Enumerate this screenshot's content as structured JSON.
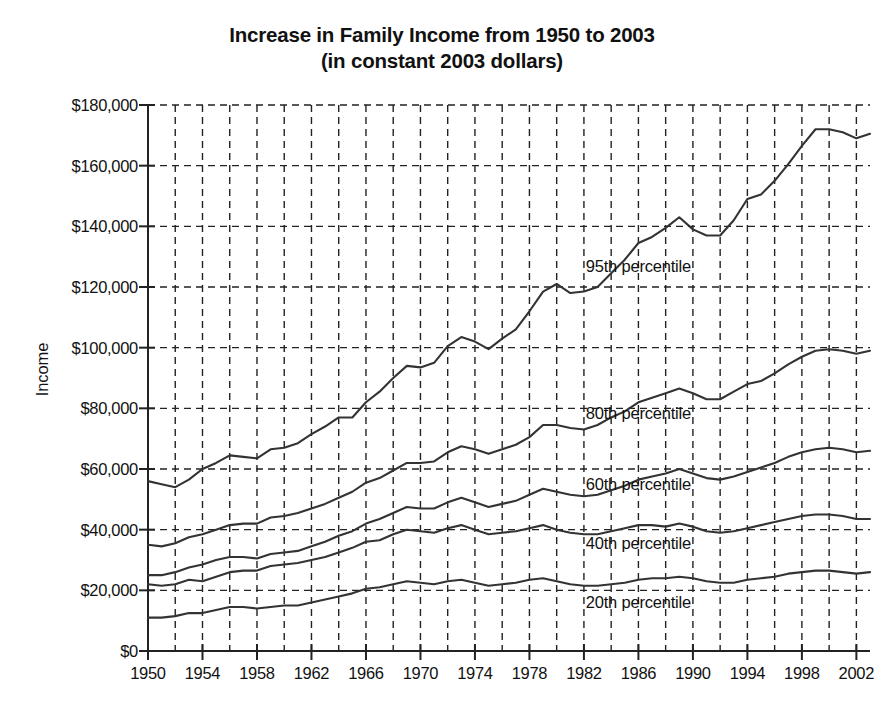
{
  "chart_data": {
    "type": "line",
    "title": "Increase in Family Income from 1950 to 2003",
    "subtitle": "(in constant 2003 dollars)",
    "xlabel": "",
    "ylabel": "Income",
    "xlim": [
      1950,
      2003
    ],
    "ylim": [
      0,
      180000
    ],
    "grid": true,
    "grid_style": "dashed",
    "legend": "inline-annotations",
    "y_tick_labels": [
      "$180,000",
      "$160,000",
      "$140,000",
      "$120,000",
      "$100,000",
      "$80,000",
      "$60,000",
      "$40,000",
      "$20,000",
      "$0"
    ],
    "y_tick_values": [
      180000,
      160000,
      140000,
      120000,
      100000,
      80000,
      60000,
      40000,
      20000,
      0
    ],
    "x_tick_labels": [
      "1950",
      "1954",
      "1958",
      "1962",
      "1966",
      "1970",
      "1974",
      "1978",
      "1982",
      "1986",
      "1990",
      "1994",
      "1998",
      "2002"
    ],
    "x_tick_values": [
      1950,
      1954,
      1958,
      1962,
      1966,
      1970,
      1974,
      1978,
      1982,
      1986,
      1990,
      1994,
      1998,
      2002
    ],
    "x": [
      1950,
      1951,
      1952,
      1953,
      1954,
      1955,
      1956,
      1957,
      1958,
      1959,
      1960,
      1961,
      1962,
      1963,
      1964,
      1965,
      1966,
      1967,
      1968,
      1969,
      1970,
      1971,
      1972,
      1973,
      1974,
      1975,
      1976,
      1977,
      1978,
      1979,
      1980,
      1981,
      1982,
      1983,
      1984,
      1985,
      1986,
      1987,
      1988,
      1989,
      1990,
      1991,
      1992,
      1993,
      1994,
      1995,
      1996,
      1997,
      1998,
      1999,
      2000,
      2001,
      2002,
      2003
    ],
    "series": [
      {
        "name": "95th percentile",
        "color": "#333333",
        "label_x": 1986,
        "label_y": 127000,
        "values": [
          56000,
          55000,
          54000,
          56500,
          60000,
          62000,
          64500,
          64000,
          63500,
          66500,
          67000,
          68500,
          71500,
          74000,
          77000,
          77000,
          82000,
          85500,
          90000,
          94000,
          93500,
          95000,
          100500,
          103500,
          102000,
          99500,
          103000,
          106000,
          112000,
          118500,
          121000,
          118000,
          118500,
          120000,
          124500,
          129000,
          134500,
          136500,
          139500,
          143000,
          139000,
          137000,
          137000,
          142000,
          149000,
          150500,
          155000,
          160500,
          166500,
          172000,
          172000,
          171000,
          169000,
          170500
        ]
      },
      {
        "name": "80th percentile",
        "color": "#333333",
        "label_x": 1986,
        "label_y": 78500,
        "values": [
          35000,
          34500,
          35500,
          37500,
          38500,
          40000,
          41500,
          42000,
          42000,
          44000,
          44500,
          45500,
          47000,
          48500,
          50500,
          52500,
          55500,
          57000,
          59500,
          62000,
          62000,
          62500,
          65500,
          67500,
          66500,
          65000,
          66500,
          68000,
          70500,
          74500,
          74500,
          73500,
          73000,
          74500,
          77000,
          79000,
          82000,
          83500,
          85000,
          86500,
          85000,
          83000,
          83000,
          85500,
          88000,
          89000,
          91500,
          94500,
          97000,
          99000,
          99500,
          99000,
          98000,
          99000
        ]
      },
      {
        "name": "60th percentile",
        "color": "#333333",
        "label_x": 1986,
        "label_y": 55000,
        "values": [
          25000,
          25000,
          26000,
          27500,
          28500,
          30000,
          31000,
          31000,
          30500,
          32000,
          32500,
          33000,
          34500,
          36000,
          38000,
          39500,
          42000,
          43500,
          45500,
          47500,
          47000,
          47000,
          49000,
          50500,
          49000,
          47500,
          48500,
          49500,
          51500,
          53500,
          52500,
          51500,
          51000,
          51500,
          53000,
          54500,
          56500,
          57500,
          58500,
          60000,
          58500,
          57000,
          56500,
          57500,
          59000,
          60500,
          62000,
          64000,
          65500,
          66500,
          67000,
          66500,
          65500,
          66000
        ]
      },
      {
        "name": "40th percentile",
        "color": "#333333",
        "label_x": 1986,
        "label_y": 35500,
        "values": [
          22000,
          21500,
          22000,
          23500,
          23000,
          24500,
          26000,
          26500,
          26500,
          28000,
          28500,
          29000,
          30000,
          31000,
          32500,
          34000,
          36000,
          36500,
          38500,
          40000,
          39500,
          39000,
          40500,
          41500,
          40000,
          38500,
          39000,
          39500,
          40500,
          41500,
          40000,
          39000,
          38500,
          38500,
          39500,
          40500,
          41500,
          41500,
          41000,
          42000,
          41000,
          39500,
          39000,
          39500,
          40500,
          41500,
          42500,
          43500,
          44500,
          45000,
          45000,
          44500,
          43500,
          43500
        ]
      },
      {
        "name": "20th percentile",
        "color": "#333333",
        "label_x": 1986,
        "label_y": 16000,
        "values": [
          11000,
          11000,
          11500,
          12500,
          12500,
          13500,
          14500,
          14500,
          14000,
          14500,
          15000,
          15000,
          16000,
          17000,
          18000,
          19000,
          20500,
          21000,
          22000,
          23000,
          22500,
          22000,
          23000,
          23500,
          22500,
          21500,
          22000,
          22500,
          23500,
          24000,
          23000,
          22000,
          21500,
          21500,
          22000,
          22500,
          23500,
          24000,
          24000,
          24500,
          24000,
          23000,
          22500,
          22500,
          23500,
          24000,
          24500,
          25500,
          26000,
          26500,
          26500,
          26000,
          25500,
          26000
        ]
      }
    ]
  }
}
